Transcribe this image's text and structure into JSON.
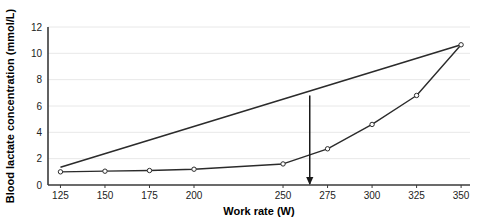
{
  "chart_data": {
    "type": "line",
    "title": "",
    "xlabel": "Work rate (W)",
    "ylabel": "Blood lactate concentration (mmol/L)",
    "xlim": [
      118,
      355
    ],
    "ylim": [
      0,
      12
    ],
    "xticks": [
      125,
      150,
      175,
      200,
      250,
      275,
      300,
      325,
      350
    ],
    "yticks": [
      0,
      2,
      4,
      6,
      8,
      10,
      12
    ],
    "grid": "horizontal",
    "legend": "none",
    "series": [
      {
        "name": "Blood lactate response",
        "marker": "open-circle",
        "x": [
          125,
          150,
          175,
          200,
          250,
          275,
          300,
          325,
          350
        ],
        "values": [
          1.0,
          1.05,
          1.1,
          1.2,
          1.6,
          2.75,
          4.6,
          6.8,
          10.65
        ]
      },
      {
        "name": "Tangent / reference line",
        "marker": "none",
        "x": [
          125,
          350
        ],
        "values": [
          1.35,
          10.65
        ]
      }
    ],
    "annotations": [
      {
        "name": "lactate-threshold-arrow",
        "type": "vertical-arrow",
        "x": 265,
        "y_start": 6.8,
        "y_end": 0.0
      }
    ]
  },
  "axis": {
    "x_tick_labels": [
      "125",
      "150",
      "175",
      "200",
      "250",
      "275",
      "300",
      "325",
      "350"
    ],
    "y_tick_labels": [
      "0",
      "2",
      "4",
      "6",
      "8",
      "10",
      "12"
    ],
    "x_title": "Work rate (W)",
    "y_title": "Blood lactate concentration (mmol/L)"
  },
  "colors": {
    "line": "#2b2b2b",
    "axis": "#3a3a3a",
    "grid": "#e8e8e8",
    "background": "#ffffff",
    "text": "#111111"
  }
}
